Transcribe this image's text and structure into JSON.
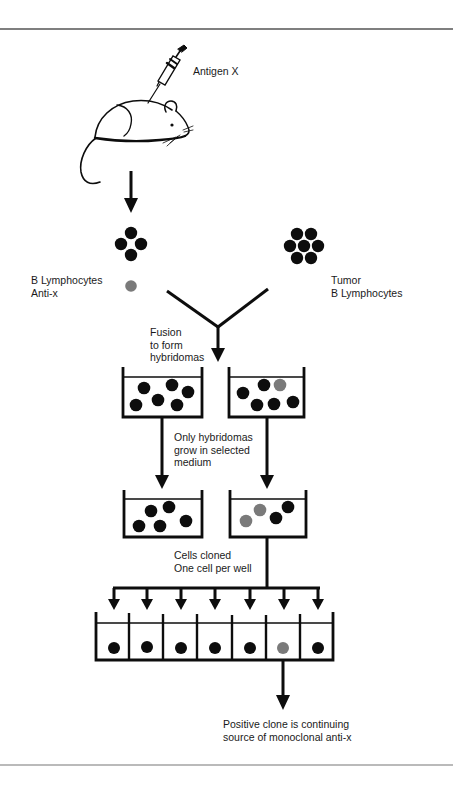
{
  "diagram": {
    "colors": {
      "ink": "#0d0d0d",
      "positive_cell": "#7a7a7a",
      "rule": "#555555",
      "background": "#ffffff"
    },
    "labels": {
      "antigen": "Antigen X",
      "b_lymphocytes": [
        "B Lymphocytes",
        "Anti-x"
      ],
      "tumor": [
        "Tumor",
        "B Lymphocytes"
      ],
      "fusion": [
        "Fusion",
        "to form",
        "hybridomas"
      ],
      "selection": [
        "Only hybridomas",
        "grow in selected",
        "medium"
      ],
      "cloning": [
        "Cells cloned",
        "One cell per well"
      ],
      "result": [
        "Positive clone is continuing",
        "source of monoclonal anti-x"
      ]
    },
    "stages": [
      {
        "name": "immunization",
        "subject": "mouse",
        "injection": "syringe"
      },
      {
        "name": "b-lymphocytes",
        "cells": 5,
        "positive": 1
      },
      {
        "name": "tumor-b-lymphocytes",
        "cells": 7,
        "positive": 0
      },
      {
        "name": "fusion-dish-1",
        "cells": 6,
        "positive": 0
      },
      {
        "name": "fusion-dish-2",
        "cells": 6,
        "positive": 1
      },
      {
        "name": "selected-dish-1",
        "cells": 5,
        "positive": 0
      },
      {
        "name": "selected-dish-2",
        "cells": 4,
        "positive": 2
      },
      {
        "name": "clone-wells",
        "wells": 7,
        "positive_well_index": 5
      }
    ]
  }
}
